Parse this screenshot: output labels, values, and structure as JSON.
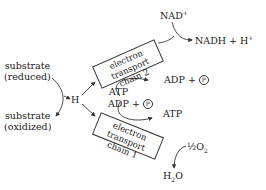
{
  "diagram": {
    "substrate_reduced": [
      "substrate",
      "(reduced)"
    ],
    "substrate_oxidized": [
      "substrate",
      "(oxidized)"
    ],
    "hydrogen": "H",
    "chain2": {
      "line1": "electron transport",
      "line2": "chain 2"
    },
    "chain1": {
      "line1": "electron transport",
      "line2": "chain 1"
    },
    "nad_plus": "NAD",
    "nad_plus_sup": "+",
    "nadh": "NADH + H",
    "nadh_sup": "+",
    "atp_top": "ATP",
    "adp_top": "ADP + ",
    "adp_right": "ADP + ",
    "atp_right": "ATP",
    "phosphate_symbol": "P",
    "half_o2_pre": "½O",
    "half_o2_sub": "2",
    "water_pre": "H",
    "water_sub": "2",
    "water_post": "O"
  }
}
